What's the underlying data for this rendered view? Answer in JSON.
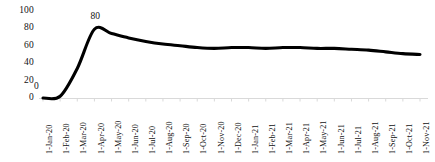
{
  "chart_data": {
    "type": "line",
    "title": "",
    "subtitle": "",
    "xlabel": "",
    "ylabel": "",
    "ylim": [
      0,
      100
    ],
    "yticks": [
      0,
      20,
      40,
      60,
      80,
      100
    ],
    "grid": false,
    "legend": false,
    "legend_position": "none",
    "line_color": "#000000",
    "axis_color": "#d9d9d9",
    "categories": [
      "1-Jan-20",
      "1-Feb-20",
      "1-Mar-20",
      "1-Apr-20",
      "1-May-20",
      "1-Jun-20",
      "1-Jul-20",
      "1-Aug-20",
      "1-Sep-20",
      "1-Oct-20",
      "1-Nov-20",
      "1-Dec-20",
      "1-Jan-21",
      "1-Feb-21",
      "1-Mar-21",
      "1-Apr-21",
      "1-May-21",
      "1-Jun-21",
      "1-Jul-21",
      "1-Aug-21",
      "1-Sep-21",
      "1-Oct-21",
      "1-Nov-21"
    ],
    "values": [
      0,
      2,
      34,
      79,
      74,
      69,
      65,
      62,
      60,
      58,
      57,
      58,
      58,
      57,
      58,
      58,
      57,
      57,
      56,
      55,
      53,
      51,
      50
    ],
    "annotations": [
      {
        "label": "0",
        "category": "1-Jan-20",
        "value": 0
      },
      {
        "label": "80",
        "category": "1-Apr-20",
        "value": 79
      }
    ]
  }
}
